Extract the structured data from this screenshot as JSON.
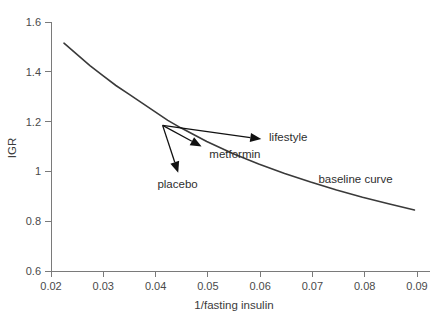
{
  "figure": {
    "background_color": "#ffffff",
    "curve_color": "#3a3a3a",
    "axis_color": "#7a7a7a",
    "arrow_color": "#111111"
  },
  "chart_data": {
    "type": "line",
    "title": "",
    "xlabel": "1/fasting insulin",
    "ylabel": "IGR",
    "xlim": [
      0.02,
      0.093
    ],
    "ylim": [
      0.6,
      1.6
    ],
    "grid": false,
    "legend": "none",
    "xticks": [
      "0.02",
      "0.03",
      "0.04",
      "0.05",
      "0.06",
      "0.07",
      "0.08",
      "0.09"
    ],
    "xtick_values": [
      0.02,
      0.03,
      0.04,
      0.05,
      0.06,
      0.07,
      0.08,
      0.09
    ],
    "yticks": [
      "0.6",
      "0.8",
      "1",
      "1.2",
      "1.4",
      "1.6"
    ],
    "ytick_values": [
      0.6,
      0.8,
      1.0,
      1.2,
      1.4,
      1.6
    ],
    "series": [
      {
        "name": "baseline curve",
        "x": [
          0.0225,
          0.025,
          0.0275,
          0.03,
          0.0325,
          0.035,
          0.0375,
          0.04,
          0.0425,
          0.045,
          0.05,
          0.055,
          0.06,
          0.065,
          0.07,
          0.075,
          0.08,
          0.085,
          0.09
        ],
        "y": [
          1.515,
          1.47,
          1.425,
          1.385,
          1.345,
          1.31,
          1.275,
          1.24,
          1.205,
          1.175,
          1.12,
          1.072,
          1.03,
          0.992,
          0.957,
          0.925,
          0.896,
          0.87,
          0.845
        ]
      }
    ],
    "annotations": [
      {
        "name": "baseline-curve",
        "label": "baseline curve",
        "text_x": 0.0715,
        "text_y": 0.955
      },
      {
        "name": "placebo",
        "label": "placebo",
        "arrow_from": [
          0.0415,
          1.185
        ],
        "arrow_to": [
          0.0445,
          0.995
        ],
        "text_x": 0.0405,
        "text_y": 0.935
      },
      {
        "name": "metformin",
        "label": "metformin",
        "arrow_from": [
          0.0415,
          1.185
        ],
        "arrow_to": [
          0.049,
          1.1
        ],
        "text_x": 0.0505,
        "text_y": 1.055
      },
      {
        "name": "lifestyle",
        "label": "lifestyle",
        "arrow_from": [
          0.0415,
          1.185
        ],
        "arrow_to": [
          0.0605,
          1.13
        ],
        "text_x": 0.062,
        "text_y": 1.122
      }
    ]
  }
}
